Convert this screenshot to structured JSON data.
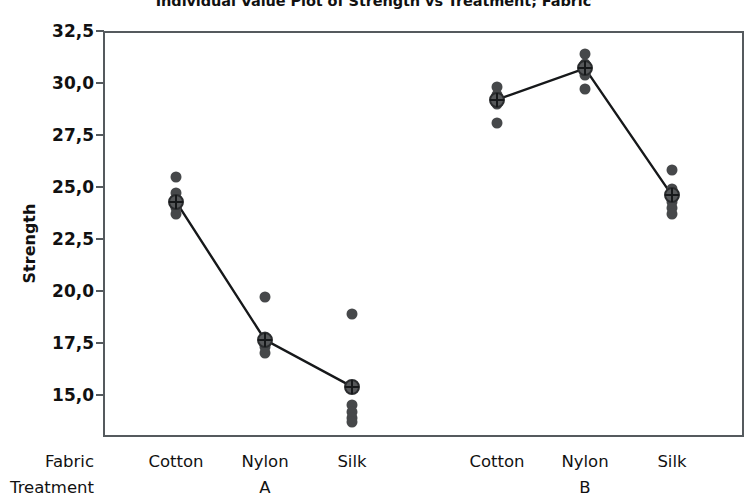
{
  "chart": {
    "title": "Individual Value Plot of Strength vs Treatment; Fabric",
    "y_axis_title": "Strength",
    "row_header_fabric": "Fabric",
    "row_header_treatment": "Treatment",
    "decimal_separator": ",",
    "dot_color": "#46484a",
    "frame_color": "#555a5e",
    "mean_marker_color": "#16181a",
    "y_ticks": [
      "32,5",
      "30,0",
      "27,5",
      "25,0",
      "22,5",
      "20,0",
      "17,5",
      "15,0"
    ],
    "fabric_labels": [
      "Cotton",
      "Nylon",
      "Silk",
      "Cotton",
      "Nylon",
      "Silk"
    ],
    "treatment_labels": [
      "A",
      "B"
    ]
  },
  "chart_data": {
    "type": "scatter",
    "title": "Individual Value Plot of Strength vs Treatment; Fabric",
    "xlabel": "",
    "ylabel": "Strength",
    "ylim": [
      13.2,
      32.5
    ],
    "yticks": [
      15.0,
      17.5,
      20.0,
      22.5,
      25.0,
      27.5,
      30.0,
      32.5
    ],
    "ytick_labels": [
      "15,0",
      "17,5",
      "20,0",
      "22,5",
      "25,0",
      "27,5",
      "30,0",
      "32,5"
    ],
    "grid": false,
    "legend": "none",
    "groups": [
      "Treatment",
      "Fabric"
    ],
    "categories": [
      {
        "treatment": "A",
        "fabric": "Cotton",
        "x_px": 176,
        "values": [
          25.5,
          24.7,
          24.3,
          24.0,
          23.7
        ],
        "mean": 24.3
      },
      {
        "treatment": "A",
        "fabric": "Nylon",
        "x_px": 265,
        "values": [
          19.7,
          17.8,
          17.5,
          17.3,
          17.0
        ],
        "mean": 17.65
      },
      {
        "treatment": "A",
        "fabric": "Silk",
        "x_px": 352,
        "values": [
          18.9,
          15.4,
          14.5,
          14.2,
          13.9,
          13.7
        ],
        "mean": 15.4
      },
      {
        "treatment": "B",
        "fabric": "Cotton",
        "x_px": 497,
        "values": [
          29.8,
          29.4,
          29.2,
          29.0,
          28.1
        ],
        "mean": 29.2
      },
      {
        "treatment": "B",
        "fabric": "Nylon",
        "x_px": 585,
        "values": [
          31.4,
          30.9,
          30.7,
          30.4,
          29.7
        ],
        "mean": 30.7
      },
      {
        "treatment": "B",
        "fabric": "Silk",
        "x_px": 672,
        "values": [
          25.8,
          24.9,
          24.6,
          24.3,
          24.0,
          23.7
        ],
        "mean": 24.6
      }
    ],
    "mean_line_segments": [
      {
        "treatment": "A",
        "points": [
          [
            176,
            24.3
          ],
          [
            265,
            17.65
          ],
          [
            352,
            15.4
          ]
        ]
      },
      {
        "treatment": "B",
        "points": [
          [
            497,
            29.2
          ],
          [
            585,
            30.7
          ],
          [
            672,
            24.6
          ]
        ]
      }
    ]
  }
}
